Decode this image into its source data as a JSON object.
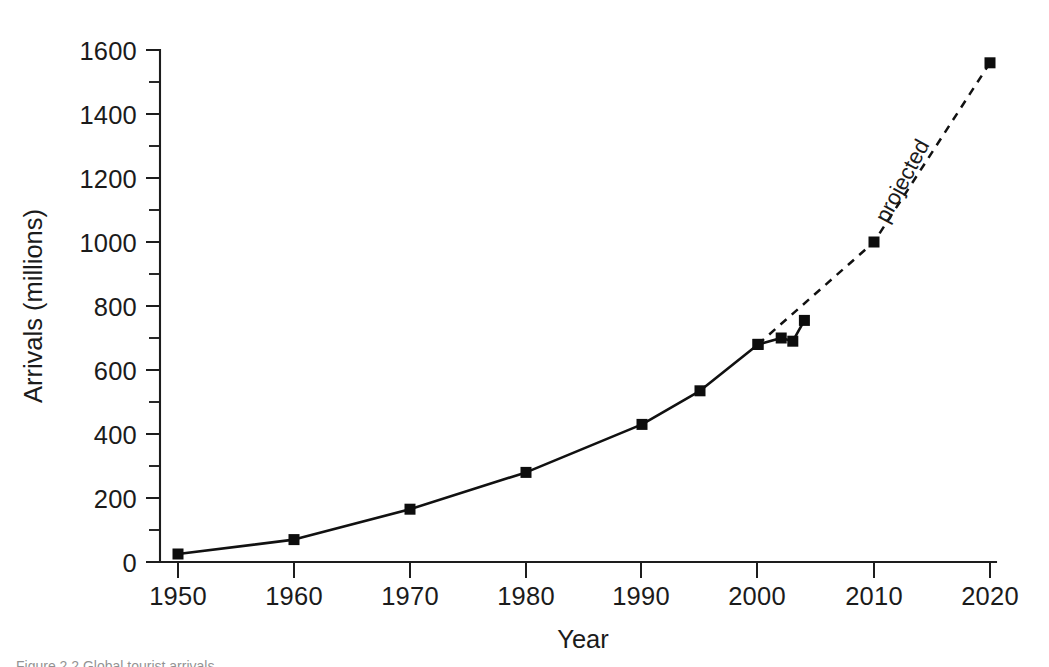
{
  "chart_data": {
    "type": "line",
    "title": "",
    "xlabel": "Year",
    "ylabel": "Arrivals (millions)",
    "xlim": [
      1950,
      2020
    ],
    "ylim": [
      0,
      1600
    ],
    "grid": false,
    "legend": "none",
    "x_ticks": [
      1950,
      1960,
      1970,
      1980,
      1990,
      2000,
      2010,
      2020
    ],
    "x_tick_labels": [
      "1950",
      "1960",
      "1970",
      "1980",
      "1990",
      "2000",
      "2010",
      "2020"
    ],
    "y_ticks": [
      0,
      200,
      400,
      600,
      800,
      1000,
      1200,
      1400,
      1600
    ],
    "y_tick_labels": [
      "0",
      "200",
      "400",
      "600",
      "800",
      "1000",
      "1200",
      "1400",
      "1600"
    ],
    "y_minor_ticks": [
      100,
      300,
      500,
      700,
      900,
      1100,
      1300,
      1500
    ],
    "marker": "square",
    "series": [
      {
        "name": "actual",
        "style": "solid",
        "x": [
          1950,
          1960,
          1970,
          1980,
          1990,
          1995,
          2000,
          2002,
          2003,
          2004
        ],
        "values": [
          25,
          70,
          165,
          280,
          430,
          535,
          680,
          700,
          690,
          755
        ]
      },
      {
        "name": "projected",
        "style": "dashed",
        "x": [
          2000,
          2010,
          2020
        ],
        "values": [
          680,
          1000,
          1560
        ]
      }
    ],
    "annotations": [
      {
        "text": "projected",
        "x": 2013,
        "y": 1180,
        "rotation": -62
      }
    ]
  },
  "figure": {
    "caption": "Figure 2.2  Global tourist arrivals"
  }
}
